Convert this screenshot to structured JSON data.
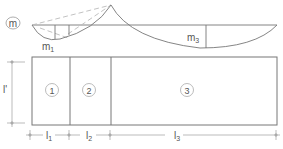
{
  "moment_diagram": {
    "label": "m",
    "labels": {
      "m1": "m",
      "m1_sub": "1",
      "m3": "m",
      "m3_sub": "3"
    }
  },
  "plan": {
    "height_label": "l'",
    "fields": [
      {
        "id": "1",
        "label": "1"
      },
      {
        "id": "2",
        "label": "2"
      },
      {
        "id": "3",
        "label": "3"
      }
    ]
  },
  "dimensions": [
    {
      "label": "l",
      "sub": "1"
    },
    {
      "label": "l",
      "sub": "2"
    },
    {
      "label": "l",
      "sub": "3"
    }
  ],
  "colors": {
    "line": "#777777",
    "dashed": "#bbbbbb",
    "text": "#555555"
  }
}
